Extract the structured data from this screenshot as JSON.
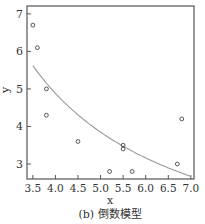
{
  "chart_data": {
    "type": "scatter",
    "title": "",
    "caption": "(b) 倒数模型",
    "xlabel": "x",
    "ylabel": "y",
    "xlim": [
      3.37,
      7.07
    ],
    "ylim": [
      2.6,
      7.21
    ],
    "xticks": [
      3.5,
      4.0,
      4.5,
      5.0,
      5.5,
      6.0,
      6.5,
      7.0
    ],
    "xtick_labels": [
      "3.5",
      "4.0",
      "4.5",
      "5.0",
      "5.5",
      "6.0",
      "6.5",
      "7.0"
    ],
    "yticks": [
      3,
      4,
      5,
      6,
      7
    ],
    "ytick_labels": [
      "3",
      "4",
      "5",
      "6",
      "7"
    ],
    "grid": false,
    "legend": null,
    "series": [
      {
        "name": "observed",
        "type": "scatter",
        "marker": "open-circle",
        "x": [
          3.5,
          3.6,
          3.8,
          3.8,
          4.5,
          5.2,
          5.5,
          5.5,
          5.7,
          6.7,
          6.8
        ],
        "y": [
          6.7,
          6.1,
          5.0,
          4.3,
          3.6,
          2.8,
          3.5,
          3.4,
          2.8,
          3.0,
          4.2
        ]
      },
      {
        "name": "reciprocal fit",
        "type": "line",
        "model": "y = a + b/x",
        "a": -0.28,
        "b": 20.65,
        "x_range": [
          3.5,
          7.0
        ]
      }
    ]
  },
  "colors": {
    "axis": "#555555",
    "marker": "#444444",
    "curve": "#999999",
    "text": "#333333"
  },
  "plot_box": {
    "left": 27,
    "top": 6,
    "right": 194,
    "bottom": 179
  }
}
